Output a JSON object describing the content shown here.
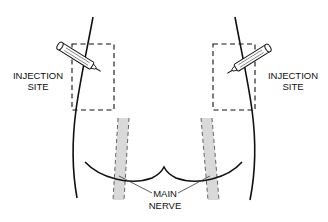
{
  "diagram": {
    "type": "anatomical-illustration",
    "colors": {
      "outline": "#111111",
      "nerve_fill": "#d9d9d9",
      "nerve_dash": "#555555",
      "background": "#ffffff"
    },
    "labels": {
      "injection_left_line1": "INJECTION",
      "injection_left_line2": "SITE",
      "injection_right_line1": "INJECTION",
      "injection_right_line2": "SITE",
      "nerve_line1": "MAIN",
      "nerve_line2": "NERVE"
    },
    "elements": [
      {
        "name": "left-body-outline",
        "kind": "curve"
      },
      {
        "name": "right-body-outline",
        "kind": "curve"
      },
      {
        "name": "left-injection-zone",
        "kind": "dashed-rectangle"
      },
      {
        "name": "right-injection-zone",
        "kind": "dashed-rectangle"
      },
      {
        "name": "left-syringe",
        "kind": "icon"
      },
      {
        "name": "right-syringe",
        "kind": "icon"
      },
      {
        "name": "gluteal-fold",
        "kind": "curve"
      },
      {
        "name": "left-sciatic-nerve",
        "kind": "shaded-band"
      },
      {
        "name": "right-sciatic-nerve",
        "kind": "shaded-band"
      }
    ]
  }
}
